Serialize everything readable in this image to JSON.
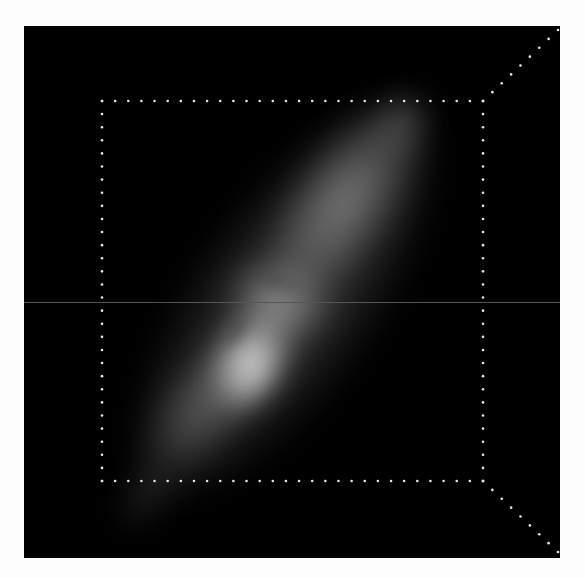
{
  "image": {
    "subject": "grayscale 3D volume rendering of an elongated diagonal galaxy-like structure inside a dotted bounding box",
    "background_color": "#fdfdfd",
    "panel_color": "#000000"
  },
  "panel": {
    "x": 24,
    "y": 26,
    "width": 536,
    "height": 532
  },
  "bounding_box": {
    "inner_rect": {
      "x1": 102,
      "y1": 101,
      "x2": 483,
      "y2": 481
    },
    "dot_spacing": 13,
    "dot_color": "#e6e6e6",
    "diagonals": [
      {
        "from": [
          483,
          101
        ],
        "to": [
          558,
          30
        ]
      },
      {
        "from": [
          483,
          481
        ],
        "to": [
          558,
          552
        ]
      }
    ]
  },
  "artifact_line": {
    "y": 302,
    "color": "#555555"
  },
  "galaxy_blobs": [
    {
      "name": "outer-halo",
      "cx": 285,
      "cy": 300,
      "rx": 95,
      "ry": 235,
      "rot": 35,
      "color": "rgba(120,120,120,0.55)"
    },
    {
      "name": "upper-lobe",
      "cx": 345,
      "cy": 200,
      "rx": 55,
      "ry": 120,
      "rot": 35,
      "color": "rgba(150,150,150,0.75)"
    },
    {
      "name": "upper-tip",
      "cx": 400,
      "cy": 125,
      "rx": 25,
      "ry": 40,
      "rot": 30,
      "color": "rgba(110,110,110,0.6)"
    },
    {
      "name": "mid-arc",
      "cx": 280,
      "cy": 300,
      "rx": 55,
      "ry": 40,
      "rot": 20,
      "color": "rgba(170,170,170,0.7)"
    },
    {
      "name": "core",
      "cx": 250,
      "cy": 360,
      "rx": 40,
      "ry": 65,
      "rot": 30,
      "color": "rgba(215,215,215,0.9)"
    },
    {
      "name": "core-bright",
      "cx": 248,
      "cy": 370,
      "rx": 24,
      "ry": 36,
      "rot": 30,
      "color": "rgba(235,235,235,0.95)"
    },
    {
      "name": "lower-lobe",
      "cx": 200,
      "cy": 410,
      "rx": 45,
      "ry": 80,
      "rot": 35,
      "color": "rgba(130,130,130,0.6)"
    },
    {
      "name": "lower-tail",
      "cx": 150,
      "cy": 490,
      "rx": 25,
      "ry": 50,
      "rot": 35,
      "color": "rgba(60,60,60,0.6)"
    }
  ],
  "dark_features": [
    {
      "name": "core-dark-ring",
      "cx": 235,
      "cy": 330,
      "rx": 12,
      "ry": 22,
      "rot": 30,
      "color": "rgba(70,70,70,0.7)"
    },
    {
      "name": "arc-gap",
      "cx": 275,
      "cy": 280,
      "rx": 40,
      "ry": 10,
      "rot": 20,
      "color": "rgba(60,60,60,0.55)"
    }
  ]
}
